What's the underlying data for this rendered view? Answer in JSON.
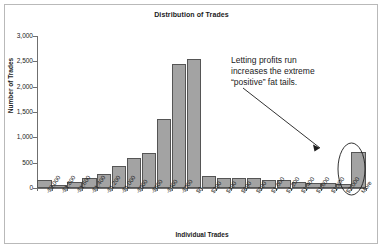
{
  "chart_data": {
    "type": "bar",
    "title": "Distribution of Trades",
    "xlabel": "Individual Trades",
    "ylabel": "Number of Trades",
    "ylim": [
      0,
      3000
    ],
    "ytick_labels": [
      "3,000",
      "2,500",
      "2,000",
      "1,500",
      "1,000",
      "500",
      "0"
    ],
    "ytick_values": [
      3000,
      2500,
      2000,
      1500,
      1000,
      500,
      0
    ],
    "grid": false,
    "legend": "none",
    "bar_color": "#a3a3a3",
    "bar_edge_color": "#555555",
    "categories": [
      "-$2,000",
      "-$1,800",
      "-$1,600",
      "-$1,400",
      "-$1,200",
      "-$1,000",
      "-$800",
      "-$600",
      "-$400",
      "-$200",
      "$0",
      "$200",
      "$400",
      "$600",
      "$800",
      "$1,000",
      "$1,200",
      "$1,400",
      "$1,600",
      "$1,800",
      "$2,000",
      "More"
    ],
    "values": [
      150,
      50,
      110,
      190,
      270,
      430,
      590,
      700,
      1360,
      2440,
      2540,
      240,
      200,
      195,
      190,
      160,
      150,
      110,
      95,
      90,
      85,
      720
    ],
    "annotations": [
      {
        "text_lines": [
          "Letting profits run",
          "increases the extreme",
          "“positive” fat tails."
        ],
        "target_category": "More",
        "marker": "ellipse-highlight",
        "arrow": "diagonal-down-right"
      }
    ]
  },
  "labels": {
    "title": "Distribution of Trades",
    "x_axis_title": "Individual Trades",
    "y_axis_title": "Number of Trades",
    "annotation_line_1": "Letting profits run",
    "annotation_line_2": "increases the extreme",
    "annotation_line_3": "“positive” fat tails."
  }
}
